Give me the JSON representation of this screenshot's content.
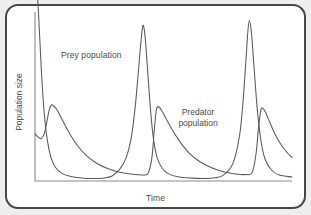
{
  "figure": {
    "kind": "line-diagram",
    "border_color": "#474747",
    "background_color": "#ffffff",
    "outer_background_color": "#eeeeee",
    "curve_color": "#585858",
    "axis_color": "#8a8a8a",
    "text_color": "#4a4a4a"
  },
  "axes": {
    "x_label": "Time",
    "y_label": "Population size"
  },
  "annotations": {
    "prey_label": "Prey population",
    "predator_label_line1": "Predator",
    "predator_label_line2": "population"
  },
  "chart_data": {
    "type": "line",
    "title": "",
    "xlabel": "Time",
    "ylabel": "Population size",
    "grid": false,
    "legend": "none",
    "xlim": [
      0,
      100
    ],
    "ylim": [
      0,
      100
    ],
    "axis_ticks": {
      "x": [],
      "y": []
    },
    "series": [
      {
        "name": "Prey population",
        "color": "#585858",
        "peaks_x": [
          1,
          42,
          83
        ],
        "peak_heights": [
          108,
          92,
          95
        ],
        "points": [
          [
            0.0,
            118
          ],
          [
            1.0,
            108
          ],
          [
            1.8,
            86
          ],
          [
            2.6,
            62
          ],
          [
            3.6,
            40
          ],
          [
            4.8,
            24
          ],
          [
            6.2,
            14
          ],
          [
            8.0,
            8
          ],
          [
            10.5,
            4.5
          ],
          [
            14.0,
            2.6
          ],
          [
            18.0,
            1.8
          ],
          [
            23.0,
            1.5
          ],
          [
            27.0,
            1.8
          ],
          [
            30.0,
            3.0
          ],
          [
            33.0,
            7.0
          ],
          [
            35.5,
            14.0
          ],
          [
            37.5,
            26.0
          ],
          [
            39.0,
            44.0
          ],
          [
            40.3,
            66.0
          ],
          [
            41.2,
            82.0
          ],
          [
            42.0,
            92.0
          ],
          [
            42.8,
            86.0
          ],
          [
            43.7,
            68.0
          ],
          [
            44.8,
            45.0
          ],
          [
            46.0,
            26.0
          ],
          [
            47.5,
            14.0
          ],
          [
            49.5,
            7.5
          ],
          [
            52.0,
            4.2
          ],
          [
            56.0,
            2.4
          ],
          [
            61.0,
            1.7
          ],
          [
            66.0,
            1.5
          ],
          [
            70.0,
            1.9
          ],
          [
            73.0,
            3.2
          ],
          [
            76.0,
            7.5
          ],
          [
            78.0,
            15.0
          ],
          [
            79.8,
            29.0
          ],
          [
            81.0,
            48.0
          ],
          [
            82.1,
            72.0
          ],
          [
            82.8,
            88.0
          ],
          [
            83.4,
            95.0
          ],
          [
            84.2,
            88.0
          ],
          [
            85.2,
            68.0
          ],
          [
            86.4,
            44.0
          ],
          [
            87.8,
            25.0
          ],
          [
            89.5,
            13.0
          ],
          [
            92.0,
            6.5
          ],
          [
            95.0,
            3.6
          ],
          [
            100.0,
            2.4
          ]
        ]
      },
      {
        "name": "Predator population",
        "color": "#585858",
        "peaks_x": [
          6,
          47,
          88
        ],
        "peak_heights": [
          45,
          44,
          43
        ],
        "points": [
          [
            0.0,
            28
          ],
          [
            1.2,
            26
          ],
          [
            2.4,
            25
          ],
          [
            3.6,
            28
          ],
          [
            4.6,
            35
          ],
          [
            5.5,
            42
          ],
          [
            6.4,
            45
          ],
          [
            7.6,
            44
          ],
          [
            9.0,
            41
          ],
          [
            11.0,
            35
          ],
          [
            13.5,
            28
          ],
          [
            16.5,
            21
          ],
          [
            20.0,
            15
          ],
          [
            24.0,
            10.5
          ],
          [
            28.0,
            7.5
          ],
          [
            33.0,
            5.2
          ],
          [
            38.0,
            4.0
          ],
          [
            42.0,
            3.6
          ],
          [
            44.0,
            4.6
          ],
          [
            45.5,
            14.0
          ],
          [
            46.4,
            30.0
          ],
          [
            47.2,
            42.0
          ],
          [
            48.0,
            44.0
          ],
          [
            49.2,
            42.0
          ],
          [
            51.0,
            37.0
          ],
          [
            53.5,
            30.0
          ],
          [
            56.5,
            23.0
          ],
          [
            60.0,
            16.5
          ],
          [
            64.0,
            11.5
          ],
          [
            68.5,
            8.0
          ],
          [
            73.0,
            5.6
          ],
          [
            78.0,
            4.2
          ],
          [
            82.0,
            3.8
          ],
          [
            84.5,
            5.0
          ],
          [
            86.0,
            16.0
          ],
          [
            87.0,
            32.0
          ],
          [
            87.9,
            42.0
          ],
          [
            88.6,
            43.0
          ],
          [
            89.6,
            41.0
          ],
          [
            91.0,
            36.0
          ],
          [
            93.0,
            29.0
          ],
          [
            95.5,
            22.0
          ],
          [
            98.0,
            17.0
          ],
          [
            100.0,
            14.0
          ]
        ]
      }
    ]
  }
}
